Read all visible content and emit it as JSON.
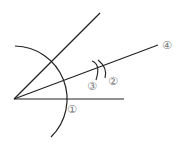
{
  "diagram": {
    "labels": {
      "step1": "①",
      "step2": "②",
      "step3": "③",
      "step4": "④"
    },
    "colors": {
      "line": "#222222",
      "label": "#777777",
      "background": "#ffffff"
    },
    "geometry": {
      "vertex": [
        14,
        99
      ],
      "ray_upper_end": [
        100,
        13
      ],
      "ray_horizontal_end": [
        124,
        99
      ],
      "ray_bisector_end": [
        158,
        45
      ],
      "arc_radius": 52,
      "intersection_point": [
        100,
        67
      ]
    }
  }
}
